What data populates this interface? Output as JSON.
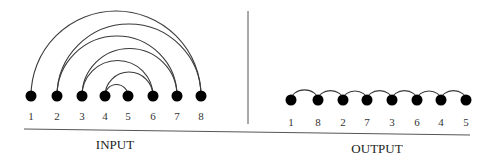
{
  "diagram": {
    "input": {
      "caption": "INPUT",
      "nodes": [
        {
          "label": "1",
          "x": 31
        },
        {
          "label": "2",
          "x": 57
        },
        {
          "label": "3",
          "x": 82
        },
        {
          "label": "4",
          "x": 105
        },
        {
          "label": "5",
          "x": 128
        },
        {
          "label": "6",
          "x": 153
        },
        {
          "label": "7",
          "x": 177
        },
        {
          "label": "8",
          "x": 201
        }
      ],
      "edges": [
        [
          "1",
          "8"
        ],
        [
          "2",
          "8"
        ],
        [
          "2",
          "7"
        ],
        [
          "3",
          "7"
        ],
        [
          "3",
          "6"
        ],
        [
          "4",
          "6"
        ],
        [
          "4",
          "5"
        ]
      ]
    },
    "output": {
      "caption": "OUTPUT",
      "nodes": [
        {
          "label": "1",
          "x": 291
        },
        {
          "label": "8",
          "x": 318
        },
        {
          "label": "2",
          "x": 343
        },
        {
          "label": "7",
          "x": 367
        },
        {
          "label": "3",
          "x": 392
        },
        {
          "label": "6",
          "x": 417
        },
        {
          "label": "4",
          "x": 441
        },
        {
          "label": "5",
          "x": 466
        }
      ],
      "edges": [
        [
          "1",
          "8"
        ],
        [
          "8",
          "2"
        ],
        [
          "2",
          "7"
        ],
        [
          "7",
          "3"
        ],
        [
          "3",
          "6"
        ],
        [
          "6",
          "4"
        ],
        [
          "4",
          "5"
        ]
      ]
    },
    "colors": {
      "node": "#000000",
      "line": "#3a3a3a"
    }
  }
}
